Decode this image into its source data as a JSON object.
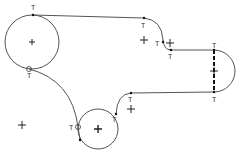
{
  "diagram": {
    "type": "cad-sketch",
    "colors": {
      "stroke": "#555555",
      "cross": "#222222",
      "point": "#111111",
      "label": "#333333",
      "background": "#ffffff"
    },
    "constraint_label": "T",
    "constraint_meaning": "tangent",
    "circles": [
      {
        "name": "large-circle",
        "cx": 32,
        "cy": 42,
        "r": 27
      },
      {
        "name": "small-circle",
        "cx": 98,
        "cy": 129,
        "r": 20
      }
    ],
    "center_marks": [
      {
        "name": "large-circle-center",
        "x": 32,
        "y": 42
      },
      {
        "name": "small-circle-center",
        "x": 98,
        "y": 129
      },
      {
        "name": "upper-arc-center",
        "x": 144,
        "y": 40
      },
      {
        "name": "step-arc-center",
        "x": 170,
        "y": 43
      },
      {
        "name": "right-arc-center",
        "x": 214,
        "y": 71
      },
      {
        "name": "lower-arc-center",
        "x": 131,
        "y": 109
      },
      {
        "name": "free-point",
        "x": 22,
        "y": 125
      }
    ],
    "tangent_labels": [
      {
        "text": "T",
        "x": 31,
        "y": 4
      },
      {
        "text": "T",
        "x": 141,
        "y": 22
      },
      {
        "text": "T",
        "x": 155,
        "y": 40
      },
      {
        "text": "T",
        "x": 168,
        "y": 53
      },
      {
        "text": "T",
        "x": 212,
        "y": 42
      },
      {
        "text": "T",
        "x": 212,
        "y": 96
      },
      {
        "text": "T",
        "x": 128,
        "y": 96
      },
      {
        "text": "T",
        "x": 27,
        "y": 72
      },
      {
        "text": "T",
        "x": 69,
        "y": 124
      },
      {
        "text": "T",
        "x": 112,
        "y": 116
      }
    ]
  }
}
